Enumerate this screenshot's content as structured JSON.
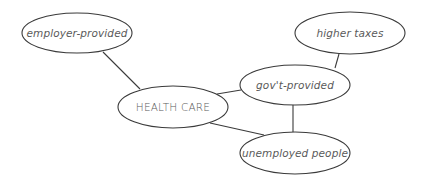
{
  "diagram": {
    "type": "concept-map",
    "stroke_color": "#3a3a3a",
    "text_color": "#5a5a5a",
    "background": "#ffffff",
    "nodes": [
      {
        "id": "employer",
        "label": "employer-provided",
        "cx": 77,
        "cy": 33,
        "rx": 55,
        "ry": 20,
        "style": "italic"
      },
      {
        "id": "health",
        "label": "HEALTH CARE",
        "cx": 173,
        "cy": 107,
        "rx": 55,
        "ry": 21,
        "style": "caps"
      },
      {
        "id": "govt",
        "label": "gov't-provided",
        "cx": 295,
        "cy": 85,
        "rx": 55,
        "ry": 20,
        "style": "italic"
      },
      {
        "id": "taxes",
        "label": "higher taxes",
        "cx": 350,
        "cy": 33,
        "rx": 55,
        "ry": 21,
        "style": "italic"
      },
      {
        "id": "unemployed",
        "label": "unemployed people",
        "cx": 295,
        "cy": 153,
        "rx": 55,
        "ry": 21,
        "style": "italic"
      }
    ],
    "edges": [
      {
        "from": "employer",
        "to": "health",
        "x1": 103,
        "y1": 52,
        "x2": 140,
        "y2": 89
      },
      {
        "from": "health",
        "to": "govt",
        "x1": 217,
        "y1": 94,
        "x2": 241,
        "y2": 90
      },
      {
        "from": "health",
        "to": "unemployed",
        "x1": 210,
        "y1": 123,
        "x2": 264,
        "y2": 135
      },
      {
        "from": "govt",
        "to": "taxes",
        "x1": 339,
        "y1": 54,
        "x2": 335,
        "y2": 68
      },
      {
        "from": "govt",
        "to": "unemployed",
        "x1": 293,
        "y1": 105,
        "x2": 293,
        "y2": 132
      }
    ]
  }
}
